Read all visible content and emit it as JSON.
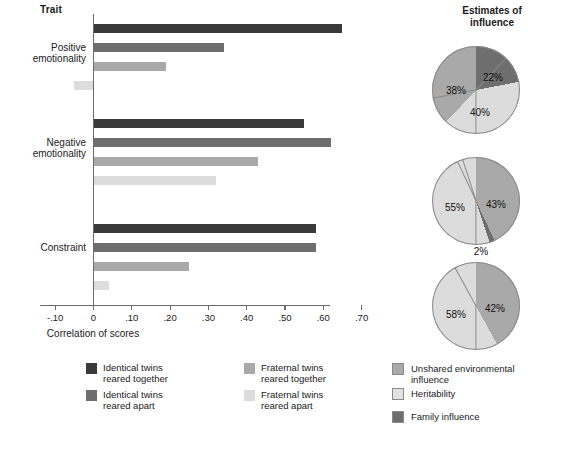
{
  "figure": {
    "trait_header": "Trait",
    "pie_header": "Estimates of\ninfluence"
  },
  "chart_data": [
    {
      "type": "bar",
      "orientation": "horizontal",
      "title": "",
      "xlabel": "Correlation of scores",
      "ylabel": "Trait",
      "xlim": [
        -0.1,
        0.7
      ],
      "xticks": [
        "-.10",
        "0",
        ".10",
        ".20",
        ".30",
        ".40",
        ".50",
        ".60",
        ".70"
      ],
      "xtick_values": [
        -0.1,
        0,
        0.1,
        0.2,
        0.3,
        0.4,
        0.5,
        0.6,
        0.7
      ],
      "grid": false,
      "categories": [
        "Positive emotionality",
        "Negative emotionality",
        "Constraint"
      ],
      "legend_position": "bottom",
      "series": [
        {
          "name": "Identical twins reared together",
          "color": "#3a3a3a",
          "values": [
            0.65,
            0.55,
            0.58
          ]
        },
        {
          "name": "Identical twins reared apart",
          "color": "#6e6e6e",
          "values": [
            0.34,
            0.62,
            0.58
          ]
        },
        {
          "name": "Fraternal twins reared together",
          "color": "#a9a9a9",
          "values": [
            0.19,
            0.43,
            0.25
          ]
        },
        {
          "name": "Fraternal twins reared apart",
          "color": "#dcdcdc",
          "values": [
            -0.05,
            0.32,
            0.04
          ]
        }
      ]
    },
    {
      "type": "pie",
      "title": "Estimates of influence",
      "trait": "Positive emotionality",
      "labels": [
        "Family influence",
        "Heritability",
        "Unshared environmental influence"
      ],
      "values": [
        22,
        40,
        38
      ],
      "value_labels": [
        "22%",
        "40%",
        "38%"
      ],
      "colors": [
        "#6e6e6e",
        "#dcdcdc",
        "#a9a9a9"
      ]
    },
    {
      "type": "pie",
      "title": "Estimates of influence",
      "trait": "Negative emotionality",
      "labels": [
        "Unshared environmental influence",
        "Family influence",
        "Heritability"
      ],
      "values": [
        43,
        2,
        55
      ],
      "value_labels": [
        "43%",
        "2%",
        "55%"
      ],
      "colors": [
        "#a9a9a9",
        "#6e6e6e",
        "#dcdcdc"
      ]
    },
    {
      "type": "pie",
      "title": "Estimates of influence",
      "trait": "Constraint",
      "labels": [
        "Unshared environmental influence",
        "Heritability"
      ],
      "values": [
        42,
        58
      ],
      "value_labels": [
        "42%",
        "58%"
      ],
      "colors": [
        "#a9a9a9",
        "#dcdcdc"
      ]
    }
  ],
  "axis": {
    "x_title": "Correlation of scores",
    "ticks": [
      {
        "label": "-.10",
        "value": -0.1
      },
      {
        "label": "0",
        "value": 0
      },
      {
        "label": ".10",
        "value": 0.1
      },
      {
        "label": ".20",
        "value": 0.2
      },
      {
        "label": ".30",
        "value": 0.3
      },
      {
        "label": ".40",
        "value": 0.4
      },
      {
        "label": ".50",
        "value": 0.5
      },
      {
        "label": ".60",
        "value": 0.6
      },
      {
        "label": ".70",
        "value": 0.7
      }
    ]
  },
  "groups": [
    {
      "label": "Positive\nemotionality"
    },
    {
      "label": "Negative\nemotionality"
    },
    {
      "label": "Constraint"
    }
  ],
  "bar_legend": [
    {
      "label": "Identical twins\nreared together",
      "color": "#3a3a3a"
    },
    {
      "label": "Fraternal twins\nreared together",
      "color": "#a9a9a9"
    },
    {
      "label": "Identical twins\nreared apart",
      "color": "#6e6e6e"
    },
    {
      "label": "Fraternal twins\nreared apart",
      "color": "#dcdcdc"
    }
  ],
  "pie_legend": [
    {
      "label": "Unshared environmental\ninfluence",
      "color": "#a9a9a9"
    },
    {
      "label": "Heritability",
      "color": "#e2e2e2"
    },
    {
      "label": "Family influence",
      "color": "#6e6e6e"
    }
  ]
}
